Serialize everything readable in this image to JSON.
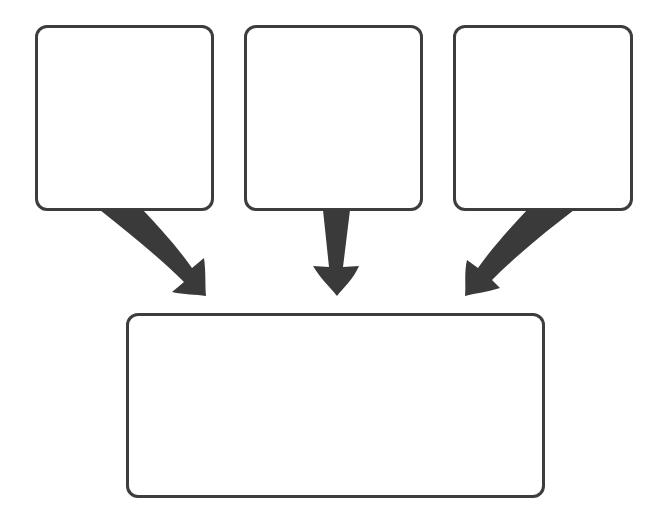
{
  "diagram": {
    "type": "three-to-one flow (graphic organizer)",
    "colors": {
      "stroke": "#3d3d3d",
      "arrow": "#3a3a3a",
      "background": "#ffffff"
    },
    "top_boxes": [
      {
        "id": "box-1",
        "label": ""
      },
      {
        "id": "box-2",
        "label": ""
      },
      {
        "id": "box-3",
        "label": ""
      }
    ],
    "bottom_box": {
      "id": "result-box",
      "label": ""
    },
    "arrows": [
      {
        "from": "box-1",
        "to": "result-box",
        "icon": "arrow-down-right-icon"
      },
      {
        "from": "box-2",
        "to": "result-box",
        "icon": "arrow-down-icon"
      },
      {
        "from": "box-3",
        "to": "result-box",
        "icon": "arrow-down-left-icon"
      }
    ]
  }
}
